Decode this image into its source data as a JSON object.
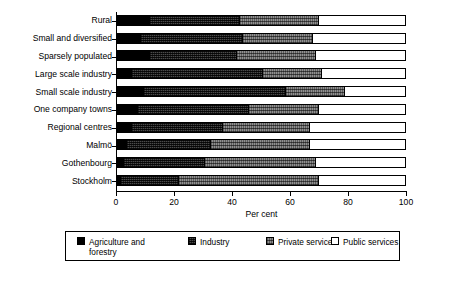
{
  "chart_data": {
    "type": "bar",
    "orientation": "horizontal",
    "stacked": true,
    "title": "",
    "xlabel": "Per cent",
    "ylabel": "",
    "xlim": [
      0,
      100
    ],
    "xticks": [
      0,
      20,
      40,
      60,
      80,
      100
    ],
    "grid": false,
    "legend_position": "bottom",
    "categories": [
      "Rural",
      "Small and diversified",
      "Sparsely populated",
      "Large scale industry",
      "Small scale industry",
      "One company towns",
      "Regional centres",
      "Malmö",
      "Gothenbourg",
      "Stockholm"
    ],
    "series": [
      {
        "name": "Agriculture and\nforestry",
        "legend_label": "Agriculture and\nforestry",
        "fill": "solid-black",
        "color": "#000000",
        "values": [
          11,
          8,
          11,
          5,
          9,
          7,
          5,
          3,
          2,
          1
        ]
      },
      {
        "name": "Industry",
        "legend_label": "Industry",
        "fill": "dense-hatch",
        "color": "#4a4a4a",
        "values": [
          31,
          35,
          30,
          45,
          49,
          38,
          31,
          29,
          28,
          20
        ]
      },
      {
        "name": "Private services",
        "legend_label": "Private services",
        "fill": "medium-hatch",
        "color": "#8f8f8f",
        "values": [
          27,
          24,
          27,
          20,
          20,
          24,
          30,
          34,
          38,
          48
        ]
      },
      {
        "name": "Public services",
        "legend_label": "Public services",
        "fill": "white",
        "color": "#ffffff",
        "values": [
          31,
          33,
          32,
          30,
          22,
          31,
          34,
          34,
          32,
          31
        ]
      }
    ]
  }
}
